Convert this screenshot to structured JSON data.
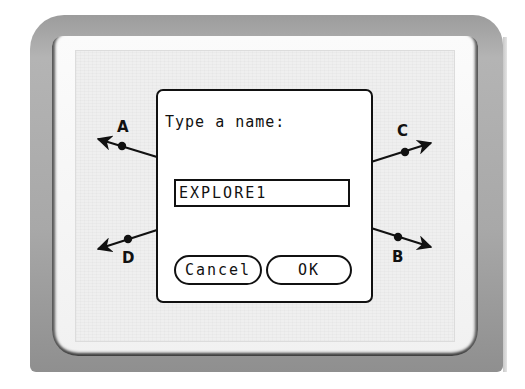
{
  "device": {
    "type": "handheld-calculator-screen"
  },
  "geometry": {
    "points": [
      {
        "label": "A",
        "x": 122,
        "y": 146
      },
      {
        "label": "C",
        "x": 405,
        "y": 152
      },
      {
        "label": "D",
        "x": 128,
        "y": 239
      },
      {
        "label": "B",
        "x": 398,
        "y": 237
      }
    ],
    "colors": {
      "stroke": "#111111",
      "screen_bg": "#efefef"
    }
  },
  "dialog": {
    "prompt": "Type a name:",
    "input_value": "EXPLORE1",
    "cancel_label": "Cancel",
    "ok_label": "OK"
  }
}
